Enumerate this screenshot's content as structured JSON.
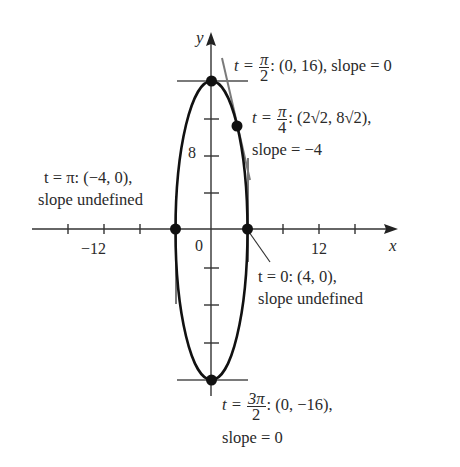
{
  "diagram": {
    "type": "parametric-ellipse",
    "curve": {
      "x_semi_axis": 4,
      "y_semi_axis": 16
    },
    "axes": {
      "x_label": "x",
      "y_label": "y",
      "origin_label": "0",
      "x_tick_label": "12",
      "x_neg_tick_label": "−12",
      "y_tick_label": "8"
    },
    "points": [
      {
        "id": "t-pi-over-2",
        "t_prefix": "t = ",
        "t_num": "π",
        "t_den": "2",
        "coords": ": (0, 16), slope = 0"
      },
      {
        "id": "t-pi-over-4",
        "t_prefix": "t = ",
        "t_num": "π",
        "t_den": "4",
        "coords": ": (2√2, 8√2),",
        "line2": "slope = −4"
      },
      {
        "id": "t-pi",
        "line1": "t = π: (−4, 0),",
        "line2": "slope undefined"
      },
      {
        "id": "t-0",
        "line1": "t = 0: (4, 0),",
        "line2": "slope undefined"
      },
      {
        "id": "t-3pi-over-2",
        "t_prefix": "t = ",
        "t_num": "3π",
        "t_den": "2",
        "coords": ": (0, −16),",
        "line2": "slope = 0"
      }
    ],
    "colors": {
      "curve": "#111111",
      "axes": "#333333",
      "tangent": "#777777",
      "point": "#111111"
    }
  }
}
